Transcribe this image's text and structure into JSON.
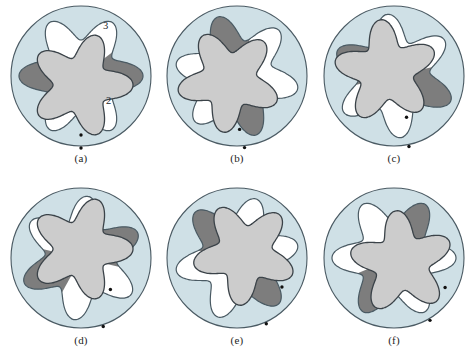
{
  "figure": {
    "background_color": "#ffffff",
    "panel_count": 6
  },
  "colors": {
    "housing_fill": "#cfe0e6",
    "housing_stroke": "#4a5a63",
    "rotor_fill": "#cccccc",
    "rotor_stroke": "#3b4349",
    "chamber_dark": "#7d7d7d",
    "chamber_light": "#ffffff",
    "marker_dot": "#111111",
    "text": "#1d1d1d"
  },
  "annotations": {
    "outer_ring_label": "3",
    "inner_rotor_label": "2"
  },
  "panels": [
    {
      "id": "a",
      "caption": "(a)",
      "rotor_angle_deg": 0,
      "ring_angle_deg": 0,
      "dark_chamber_index": 0,
      "light_chamber_indices": [
        1,
        5
      ],
      "rotor_dot_angle_deg": 90,
      "ring_dot_angle_deg": 90,
      "has_labels": true
    },
    {
      "id": "b",
      "caption": "(b)",
      "rotor_angle_deg": 24,
      "ring_angle_deg": 12,
      "dark_chamber_index": 4,
      "light_chamber_indices": [
        0,
        2
      ],
      "rotor_dot_angle_deg": 78,
      "ring_dot_angle_deg": 84,
      "has_labels": false
    },
    {
      "id": "c",
      "caption": "(c)",
      "rotor_angle_deg": 48,
      "ring_angle_deg": 24,
      "dark_chamber_index": 3,
      "light_chamber_indices": [
        5,
        1
      ],
      "rotor_dot_angle_deg": 66,
      "ring_dot_angle_deg": 78,
      "has_labels": false
    },
    {
      "id": "d",
      "caption": "(d)",
      "rotor_angle_deg": 72,
      "ring_angle_deg": 36,
      "dark_chamber_index": 2,
      "light_chamber_indices": [
        4,
        0
      ],
      "rotor_dot_angle_deg": 54,
      "ring_dot_angle_deg": 72,
      "has_labels": false
    },
    {
      "id": "e",
      "caption": "(e)",
      "rotor_angle_deg": 96,
      "ring_angle_deg": 48,
      "dark_chamber_index": 0,
      "light_chamber_indices": [
        1,
        5
      ],
      "rotor_dot_angle_deg": 42,
      "ring_dot_angle_deg": 66,
      "has_labels": false
    },
    {
      "id": "f",
      "caption": "(f)",
      "rotor_angle_deg": 120,
      "ring_angle_deg": 60,
      "dark_chamber_index": 4,
      "light_chamber_indices": [
        0,
        2
      ],
      "rotor_dot_angle_deg": 30,
      "ring_dot_angle_deg": 60,
      "has_labels": false
    }
  ],
  "geometry": {
    "housing_radius": 70,
    "ring_lobes": 6,
    "ring_mean_radius": 49,
    "ring_lobe_amp": 13,
    "rotor_lobes": 5,
    "rotor_mean_radius": 40,
    "rotor_lobe_amp": 12,
    "eccentricity": 9
  }
}
